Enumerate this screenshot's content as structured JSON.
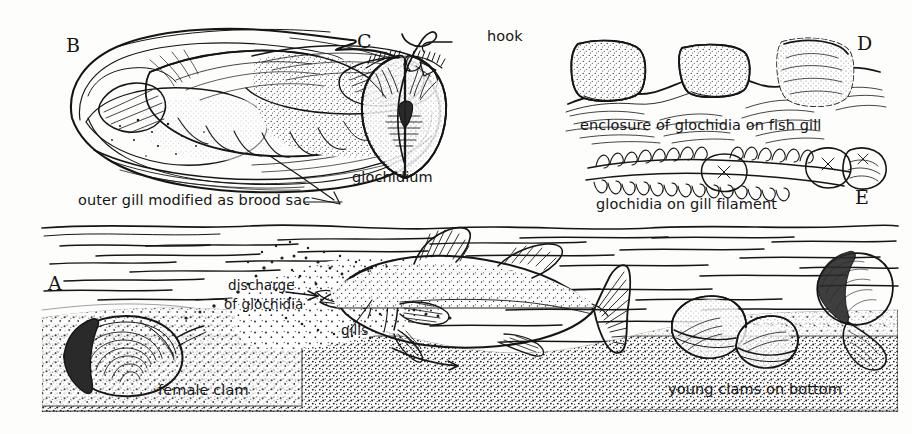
{
  "figure": {
    "background_color": "#fdfdfc",
    "ink_color": "#151515",
    "style": "pen-and-ink scientific line drawing"
  },
  "panels": {
    "b": {
      "letter": "B",
      "caption": "outer gill modified as brood sac",
      "subject": "opened clam showing gills"
    },
    "c": {
      "letter": "C",
      "caption": "glochidium",
      "callout": "hook",
      "subject": "single glochidium larva with hooks"
    },
    "d": {
      "letter": "D",
      "caption": "enclosure of glochidia on fish gill",
      "subject": "glochidia cysts encapsulated in fish gill tissue"
    },
    "e": {
      "letter": "E",
      "caption": "glochidia on gill filament",
      "subject": "glochidia attached along a gill filament"
    },
    "a": {
      "letter": "A",
      "labels": {
        "discharge_line1": "discharge",
        "discharge_line2": "of glochidia",
        "gills": "gills",
        "female_clam": "female clam",
        "young_clams": "young clams on bottom"
      },
      "subject": "underwater scene: female clam discharging glochidia toward a fish; young clams settling on the bottom"
    }
  }
}
